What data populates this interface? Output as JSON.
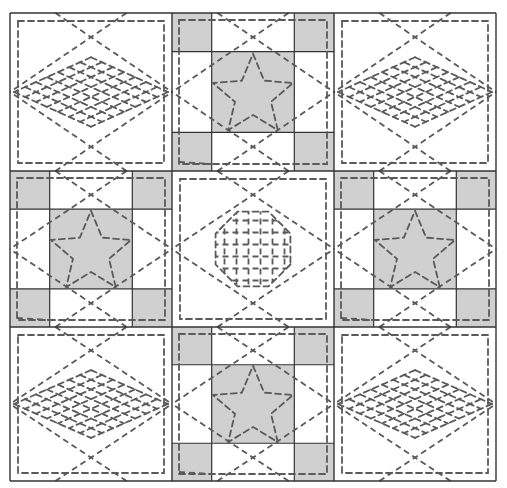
{
  "diagram": {
    "type": "3x3 quilt layout",
    "colors": {
      "background": "#ffffff",
      "fabric_light": "#ffffff",
      "fabric_gray": "#d0d0d0",
      "seam_line": "#333333",
      "quilting_stitch": "#5a5a5a"
    },
    "grid": {
      "x": [
        10,
        172,
        334,
        496
      ],
      "y": [
        13,
        171,
        327,
        481
      ]
    },
    "blocks": [
      {
        "row": 0,
        "col": 0,
        "kind": "diamond-crosshatch"
      },
      {
        "row": 0,
        "col": 1,
        "kind": "star-nine-patch"
      },
      {
        "row": 0,
        "col": 2,
        "kind": "diamond-crosshatch"
      },
      {
        "row": 1,
        "col": 0,
        "kind": "star-nine-patch"
      },
      {
        "row": 1,
        "col": 1,
        "kind": "octagon-grid"
      },
      {
        "row": 1,
        "col": 2,
        "kind": "star-nine-patch"
      },
      {
        "row": 2,
        "col": 0,
        "kind": "diamond-crosshatch"
      },
      {
        "row": 2,
        "col": 1,
        "kind": "star-nine-patch"
      },
      {
        "row": 2,
        "col": 2,
        "kind": "diamond-crosshatch"
      }
    ],
    "legend": []
  }
}
